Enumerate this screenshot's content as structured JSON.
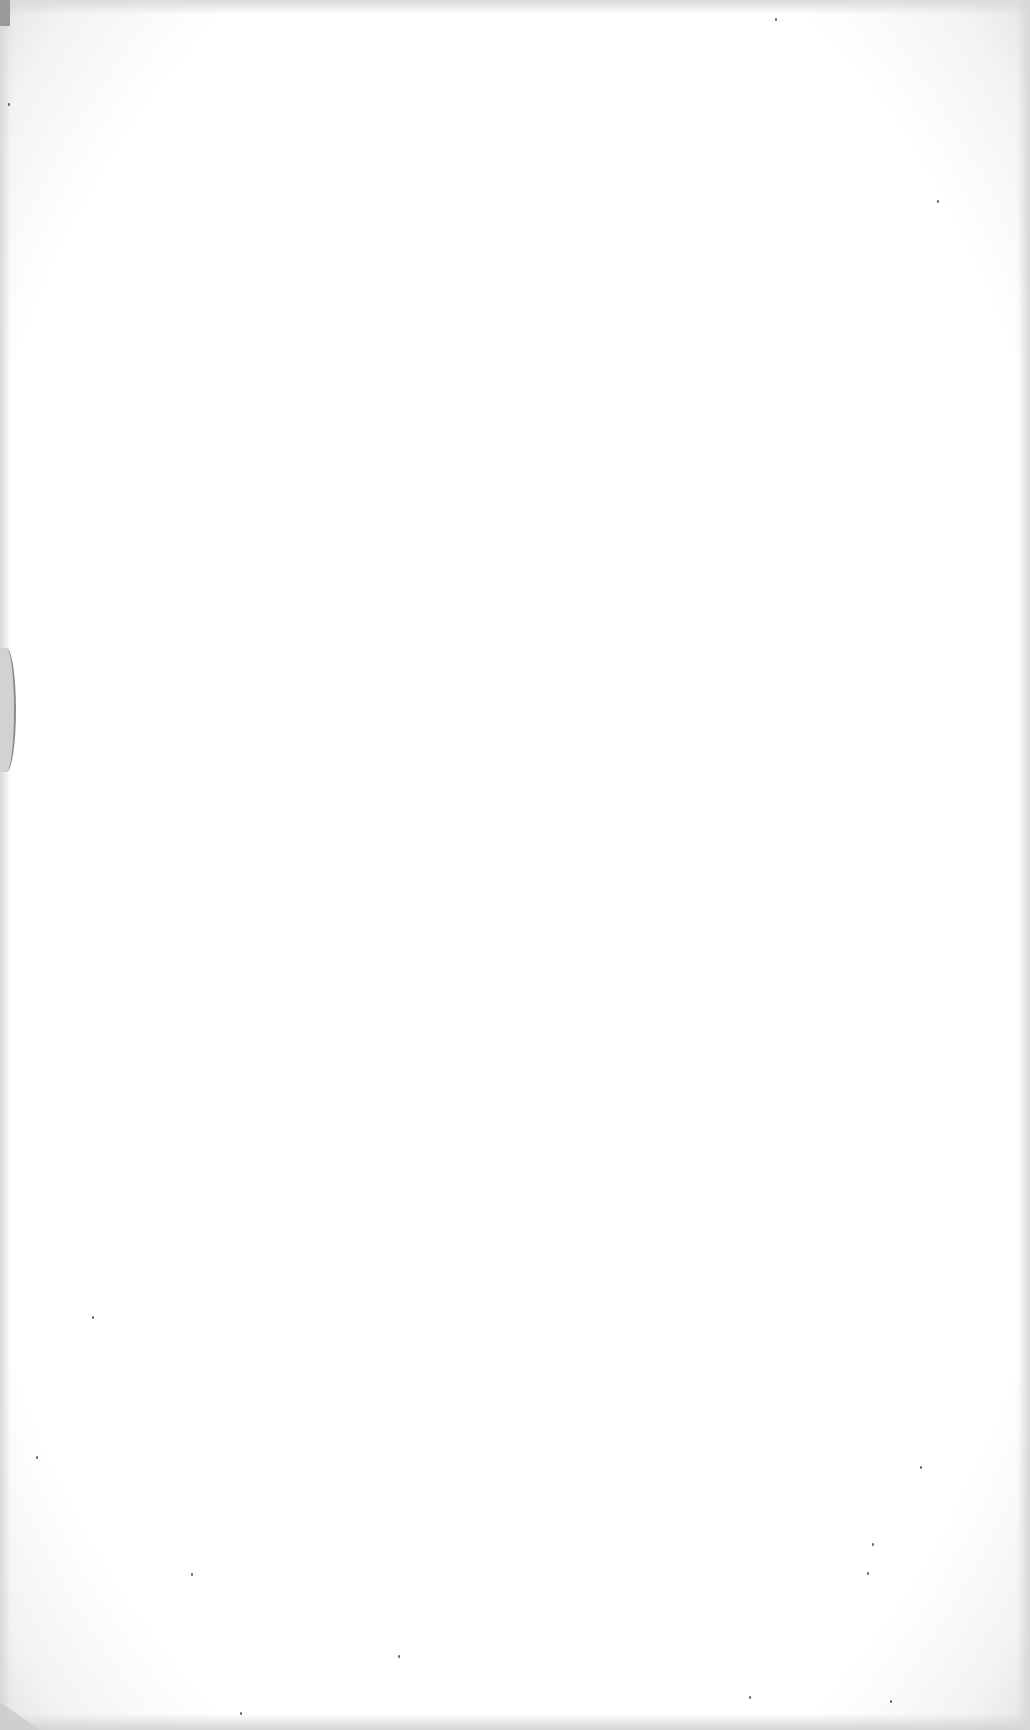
{
  "document": {
    "type": "scanned-page",
    "content": "",
    "is_blank": true
  }
}
